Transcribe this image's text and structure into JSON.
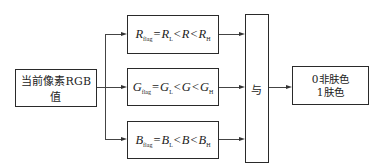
{
  "diagram": {
    "input_box": {
      "label": "当前像素RGB值"
    },
    "conditions": [
      {
        "var": "R",
        "flag_sub": "flag",
        "eq": "=",
        "lower": "R",
        "lower_sub": "L",
        "lt1": "<",
        "mid": "R",
        "lt2": "<",
        "upper": "R",
        "upper_sub": "H"
      },
      {
        "var": "G",
        "flag_sub": "flag",
        "eq": "=",
        "lower": "G",
        "lower_sub": "L",
        "lt1": "<",
        "mid": "G",
        "lt2": "<",
        "upper": "G",
        "upper_sub": "H"
      },
      {
        "var": "B",
        "flag_sub": "flag",
        "eq": "=",
        "lower": "B",
        "lower_sub": "L",
        "lt1": "<",
        "mid": "B",
        "lt2": "<",
        "upper": "B",
        "upper_sub": "H"
      }
    ],
    "and_box": {
      "label": "与"
    },
    "output_box": {
      "line1": "0非肤色",
      "line2": "1肤色"
    },
    "colors": {
      "stroke": "#2a2a2a",
      "background": "#ffffff"
    }
  }
}
